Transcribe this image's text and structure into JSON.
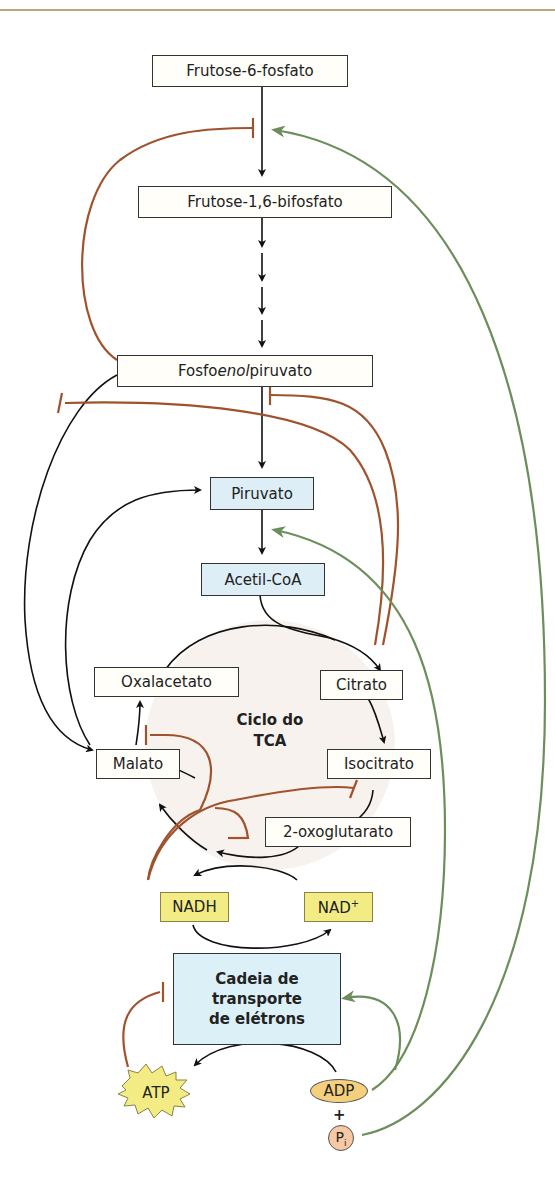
{
  "diagram": {
    "colors": {
      "inhibition": "#a0522d",
      "activation": "#6b8e5a",
      "flow": "#111111",
      "metabolite_box": "#fffef9",
      "highlight_box": "#ddeef6",
      "cofactor_box": "#f3ec84",
      "tca_circle": "#f7f2ee"
    },
    "nodes": {
      "f6p": "Frutose-6-fosfato",
      "f16bp": "Frutose-1,6-bifosfato",
      "pep_prefix": "Fosfo",
      "pep_italic": "enol",
      "pep_suffix": "piruvato",
      "pyruvate": "Piruvato",
      "acetylcoa": "Acetil-CoA",
      "oxaloacetate": "Oxalacetato",
      "citrate": "Citrato",
      "malate": "Malato",
      "isocitrate": "Isocitrato",
      "oxoglutarate": "2-oxoglutarato",
      "tca_line1": "Ciclo do",
      "tca_line2": "TCA",
      "nadh": "NADH",
      "nad_plus": "NAD",
      "nad_plus_sup": "+",
      "etc_line1": "Cadeia de",
      "etc_line2": "transporte",
      "etc_line3": "de elétrons",
      "atp": "ATP",
      "adp": "ADP",
      "plus": "+",
      "pi": "P",
      "pi_sub": "i"
    },
    "relations": [
      {
        "from": "Frutose-6-fosfato",
        "to": "Frutose-1,6-bifosfato",
        "type": "flow"
      },
      {
        "from": "Frutose-1,6-bifosfato",
        "to": "Fosfoenolpiruvato",
        "type": "flow",
        "steps": 4
      },
      {
        "from": "Fosfoenolpiruvato",
        "to": "Piruvato",
        "type": "flow"
      },
      {
        "from": "Piruvato",
        "to": "Acetil-CoA",
        "type": "flow"
      },
      {
        "from": "Acetil-CoA",
        "to": "Citrato",
        "type": "flow"
      },
      {
        "from": "Citrato",
        "to": "Isocitrato",
        "type": "flow"
      },
      {
        "from": "Isocitrato",
        "to": "2-oxoglutarato",
        "type": "flow"
      },
      {
        "from": "2-oxoglutarato",
        "to": "Malato",
        "type": "flow"
      },
      {
        "from": "Malato",
        "to": "Oxalacetato",
        "type": "flow"
      },
      {
        "from": "Fosfoenolpiruvato",
        "to": "Malato",
        "type": "flow"
      },
      {
        "from": "Malato",
        "to": "Piruvato",
        "type": "flow"
      },
      {
        "from": "NAD+",
        "to": "NADH",
        "type": "flow"
      },
      {
        "from": "NADH",
        "to": "NAD+",
        "type": "flow"
      },
      {
        "from": "ADP",
        "to": "ATP",
        "type": "flow"
      },
      {
        "from": "Fosfoenolpiruvato",
        "to": "Frutose-6-fosfato → Frutose-1,6-bifosfato",
        "type": "inhibition"
      },
      {
        "from": "Citrato",
        "to": "Fosfoenolpiruvato → Piruvato",
        "type": "inhibition"
      },
      {
        "from": "Citrato",
        "to": "Fosfoenolpiruvato → Malato",
        "type": "inhibition"
      },
      {
        "from": "NADH",
        "to": "Malato → Oxalacetato",
        "type": "inhibition"
      },
      {
        "from": "NADH",
        "to": "Isocitrato → 2-oxoglutarato",
        "type": "inhibition"
      },
      {
        "from": "NADH",
        "to": "2-oxoglutarato → Malato",
        "type": "inhibition"
      },
      {
        "from": "ATP",
        "to": "Cadeia de transporte de elétrons",
        "type": "inhibition"
      },
      {
        "from": "ADP",
        "to": "Cadeia de transporte de elétrons",
        "type": "activation"
      },
      {
        "from": "ADP",
        "to": "Piruvato → Acetil-CoA",
        "type": "activation"
      },
      {
        "from": "Pi",
        "to": "Frutose-6-fosfato → Frutose-1,6-bifosfato",
        "type": "activation"
      }
    ]
  }
}
